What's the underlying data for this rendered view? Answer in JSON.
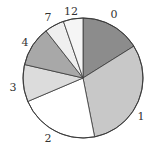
{
  "chart_data": {
    "type": "pie",
    "title": "",
    "start_angle_deg": 0,
    "direction": "clockwise",
    "categories": [
      "0",
      "1",
      "2",
      "3",
      "4",
      "7",
      "12"
    ],
    "values": [
      16.1,
      30.8,
      21.7,
      10.0,
      10.8,
      5.3,
      5.3
    ],
    "colors": [
      "#8c8c8c",
      "#c8c8c8",
      "#ffffff",
      "#dcdcdc",
      "#a8a8a8",
      "#efefef",
      "#f5f5f5"
    ],
    "label_positions": [
      {
        "label": "0",
        "x": 114,
        "y": 18
      },
      {
        "label": "1",
        "x": 141,
        "y": 120
      },
      {
        "label": "2",
        "x": 48,
        "y": 142
      },
      {
        "label": "3",
        "x": 13,
        "y": 91
      },
      {
        "label": "4",
        "x": 25,
        "y": 46
      },
      {
        "label": "7",
        "x": 48,
        "y": 21
      },
      {
        "label": "12",
        "x": 71,
        "y": 15
      }
    ],
    "center": [
      83,
      78
    ],
    "radius": 60,
    "legend": "none",
    "grid": false
  }
}
